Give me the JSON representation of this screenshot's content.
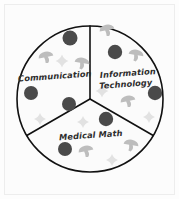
{
  "canvas": {
    "width": 179,
    "height": 199,
    "background_color": "#fdfdfd",
    "frame_color": "#ededed"
  },
  "figure": {
    "title_visible": false,
    "style": "hand-drawn pie chart with three equal sectors"
  },
  "chart_data": {
    "type": "pie",
    "title": "",
    "xlabel": "",
    "ylabel": "",
    "grid": false,
    "legend_position": "none",
    "labels_inside_slices": true,
    "categories": [
      "Communication",
      "Information Technology",
      "Medical Math"
    ],
    "values": [
      33.3,
      33.3,
      33.3
    ],
    "value_unit": "percent",
    "slice_colors": [
      "#fbfbfb",
      "#fbfbfb",
      "#fbfbfb"
    ],
    "outline_color": "#111111",
    "annotations": [
      {
        "label": "Communication",
        "slice": 1,
        "lines": [
          "Communication"
        ]
      },
      {
        "label": "Information Technology",
        "slice": 2,
        "lines": [
          "Information",
          "Technology"
        ]
      },
      {
        "label": "Medical Math",
        "slice": 3,
        "lines": [
          "Medical Math"
        ]
      }
    ]
  },
  "pie": {
    "center_x": 90,
    "center_y": 99,
    "radius": 73,
    "stroke_width": 1.6,
    "outline_color": "#111111",
    "fill_color": "#fbfbfb",
    "divider_angles_deg": [
      90,
      210,
      330
    ]
  },
  "labels": {
    "communication": "Communication",
    "information": "Information",
    "technology": "Technology",
    "medical_math": "Medical Math"
  },
  "decorations": {
    "circle_color": "#4a4a4a",
    "star_color": "#e2e2e2",
    "mushroom_color": "#bdbdbd",
    "circles": [
      {
        "x": 70,
        "y": 38,
        "r": 7.5
      },
      {
        "x": 31,
        "y": 93,
        "r": 7.0
      },
      {
        "x": 69,
        "y": 104,
        "r": 7.0
      },
      {
        "x": 115,
        "y": 52,
        "r": 7.2
      },
      {
        "x": 155,
        "y": 93,
        "r": 7.2
      },
      {
        "x": 106,
        "y": 119,
        "r": 7.2
      },
      {
        "x": 65,
        "y": 149,
        "r": 7.0
      }
    ],
    "stars": [
      {
        "x": 62,
        "y": 61,
        "s": 6.5
      },
      {
        "x": 40,
        "y": 119,
        "s": 6.0
      },
      {
        "x": 102,
        "y": 91,
        "s": 6.5
      },
      {
        "x": 149,
        "y": 117,
        "s": 6.0
      },
      {
        "x": 83,
        "y": 122,
        "s": 6.0
      },
      {
        "x": 112,
        "y": 160,
        "s": 6.0
      }
    ],
    "mushrooms": [
      {
        "x": 46,
        "y": 57,
        "s": 7.5
      },
      {
        "x": 82,
        "y": 63,
        "s": 7.5
      },
      {
        "x": 107,
        "y": 30,
        "s": 7.5
      },
      {
        "x": 136,
        "y": 55,
        "s": 7.5
      },
      {
        "x": 128,
        "y": 101,
        "s": 7.5
      },
      {
        "x": 131,
        "y": 145,
        "s": 7.5
      },
      {
        "x": 86,
        "y": 151,
        "s": 7.5
      }
    ]
  }
}
